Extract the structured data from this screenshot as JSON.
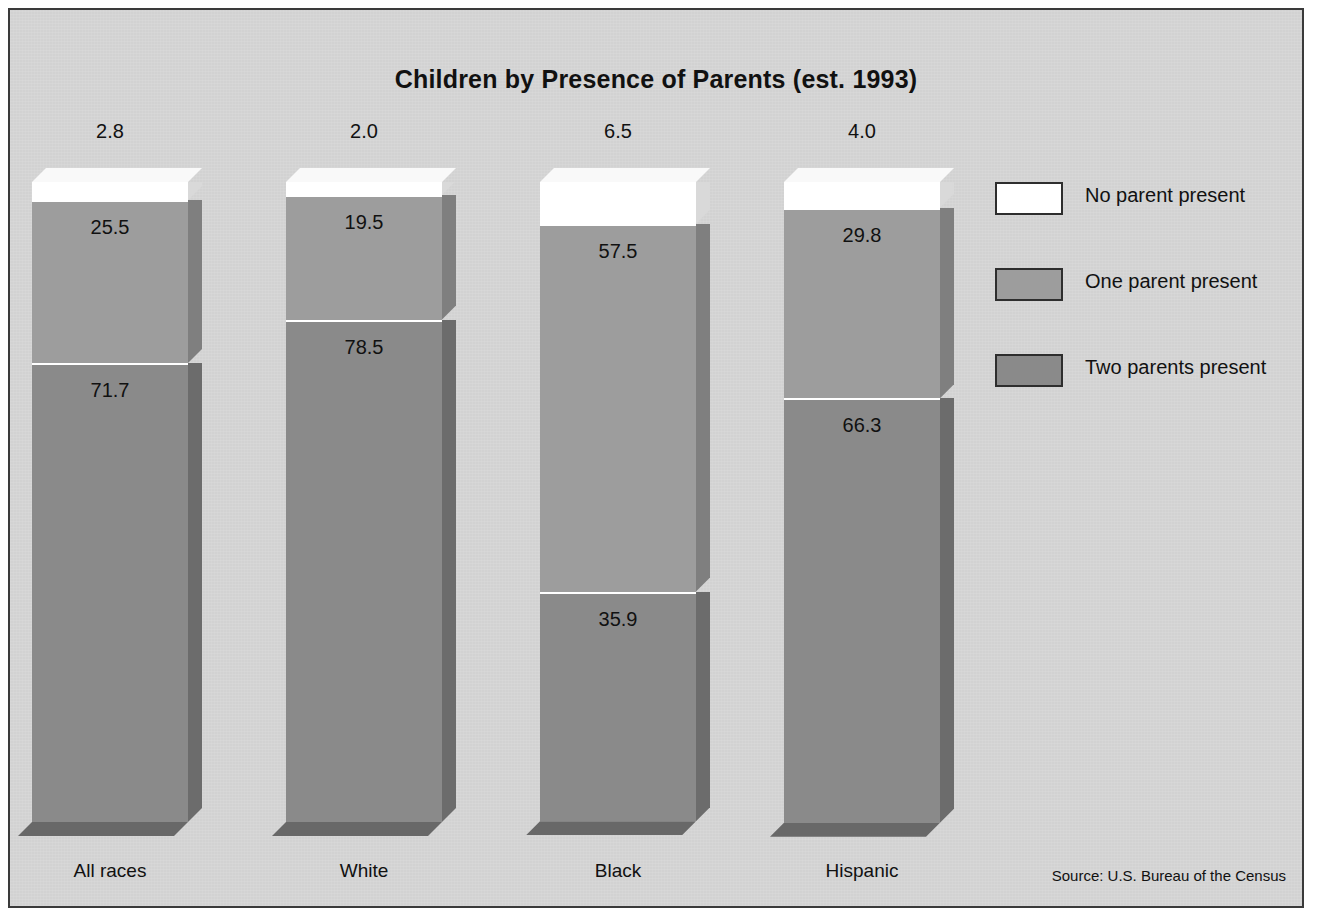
{
  "frame": {
    "background_color": "#d5d5d5",
    "border_color": "#3a3a3a"
  },
  "chart_data": {
    "type": "bar",
    "subtype": "stacked-column-3d",
    "title": "Children by Presence of Parents (est. 1993)",
    "xlabel": "",
    "ylabel": "",
    "ylim": [
      0,
      100
    ],
    "grid": false,
    "legend_position": "right",
    "categories": [
      "All races",
      "White",
      "Black",
      "Hispanic"
    ],
    "series": [
      {
        "name": "No parent present",
        "color": "#ffffff",
        "values": [
          2.8,
          2.0,
          6.5,
          4.0
        ],
        "labels": [
          "2.8",
          "2.0",
          "6.5",
          "4.0"
        ],
        "label_placement": "above-bar"
      },
      {
        "name": "One parent present",
        "color": "#9d9d9d",
        "values": [
          25.5,
          19.5,
          57.5,
          29.8
        ],
        "labels": [
          "25.5",
          "19.5",
          "57.5",
          "29.8"
        ],
        "label_placement": "inside-segment"
      },
      {
        "name": "Two parents present",
        "color": "#8a8a8a",
        "values": [
          71.7,
          78.5,
          35.9,
          66.3
        ],
        "labels": [
          "71.7",
          "78.5",
          "35.9",
          "66.3"
        ],
        "label_placement": "inside-segment"
      }
    ],
    "annotations": [
      "Source:  U.S. Bureau of the Census"
    ]
  },
  "legend": {
    "items": [
      {
        "label": "No parent present",
        "color": "#ffffff"
      },
      {
        "label": "One parent present",
        "color": "#9d9d9d"
      },
      {
        "label": "Two parents present",
        "color": "#8a8a8a"
      }
    ]
  },
  "source": {
    "text": "Source:  U.S. Bureau of the Census"
  }
}
